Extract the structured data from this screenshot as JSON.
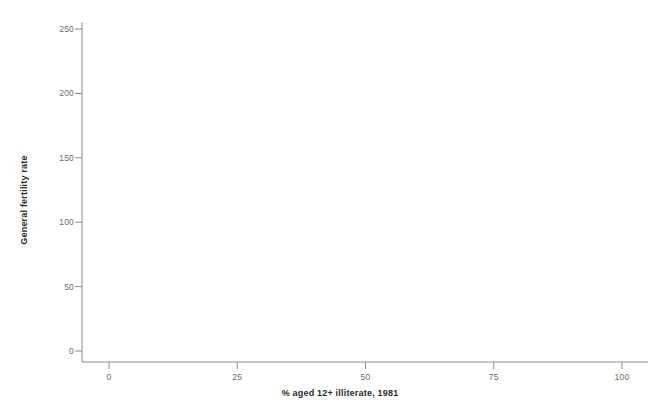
{
  "chart_data": {
    "type": "scatter",
    "title": "",
    "subtitle": "",
    "xlabel": "% aged 12+ illiterate, 1981",
    "ylabel": "General fertility rate",
    "xlim": [
      -4,
      108
    ],
    "ylim": [
      -8,
      262
    ],
    "xticks": [
      0,
      25,
      50,
      75,
      100
    ],
    "xtick_labels": [
      "0",
      "25",
      "50",
      "75",
      "100"
    ],
    "yticks": [
      0,
      50,
      100,
      150,
      200,
      250
    ],
    "ytick_labels": [
      "0",
      "50",
      "100",
      "150",
      "200",
      "250"
    ],
    "grid": false,
    "legend": null,
    "marker": {
      "shape": "open-circle",
      "radius": 2.2,
      "stroke": "#1a1a1a",
      "stroke_width": 0.8,
      "fill": "none"
    },
    "axis_color": "#8a8a8a",
    "background": "#ffffff",
    "series": [
      {
        "name": "districts",
        "kind": "scatter",
        "n_points": 1840,
        "description": "Dense cloud of Indian districts; general fertility rate rises with illiteracy. Core mass between 15-50% illiterate and 60-120 GFR.",
        "x_range": [
          3,
          89
        ],
        "y_range": [
          35,
          238
        ],
        "cluster": {
          "x_center": 33,
          "y_center": 95,
          "x_spread": 11,
          "y_spread": 28
        }
      },
      {
        "name": "regression-line",
        "kind": "line",
        "points": [
          [
            8,
            58
          ],
          [
            89,
            162
          ]
        ],
        "stroke": "#3a3a3a",
        "stroke_width": 1.0,
        "slope": 1.284,
        "intercept": 47.7
      }
    ],
    "annotations": [
      {
        "text": "isolated low-illiteracy outlier",
        "x": 3.3,
        "y": 134
      }
    ]
  },
  "axes": {
    "x_title": "% aged 12+ illiterate, 1981",
    "y_title": "General fertility rate"
  }
}
